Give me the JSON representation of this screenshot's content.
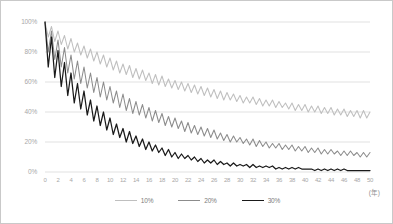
{
  "chart_data": {
    "type": "line",
    "title": "",
    "xlabel": "(年)",
    "ylabel": "",
    "xlim": [
      0,
      50
    ],
    "ylim": [
      0,
      100
    ],
    "grid": true,
    "legend_position": "bottom-center",
    "x_tick_labels": [
      "0",
      "2",
      "4",
      "6",
      "8",
      "10",
      "12",
      "14",
      "16",
      "18",
      "20",
      "22",
      "24",
      "26",
      "28",
      "30",
      "32",
      "34",
      "36",
      "38",
      "40",
      "42",
      "44",
      "46",
      "48",
      "50"
    ],
    "x_tick_values": [
      0,
      2,
      4,
      6,
      8,
      10,
      12,
      14,
      16,
      18,
      20,
      22,
      24,
      26,
      28,
      30,
      32,
      34,
      36,
      38,
      40,
      42,
      44,
      46,
      48,
      50
    ],
    "y_tick_labels": [
      "0%",
      "20%",
      "40%",
      "60%",
      "80%",
      "100%"
    ],
    "y_tick_values": [
      0,
      20,
      40,
      60,
      80,
      100
    ],
    "series": [
      {
        "name": "10%",
        "color": "#bfbfbf",
        "values": [
          100,
          90,
          97,
          87,
          94,
          85,
          91,
          82,
          89,
          80,
          86,
          78,
          84,
          76,
          82,
          74,
          80,
          72,
          78,
          70,
          76,
          68,
          74,
          66,
          72,
          65,
          71,
          63,
          69,
          62,
          68,
          61,
          66,
          59,
          65,
          58,
          64,
          57,
          62,
          56,
          61,
          55,
          60,
          54,
          59,
          53,
          58,
          52,
          57,
          51,
          56,
          50,
          55,
          49,
          54,
          48,
          53,
          48,
          52,
          47,
          51,
          46,
          50,
          46,
          50,
          45,
          49,
          44,
          48,
          44,
          48,
          43,
          47,
          43,
          46,
          42,
          46,
          41,
          45,
          41,
          45,
          40,
          44,
          40,
          44,
          39,
          43,
          39,
          43,
          38,
          42,
          38,
          42,
          37,
          41,
          37,
          41,
          36,
          41,
          36,
          40
        ]
      },
      {
        "name": "20%",
        "color": "#8c8c8c",
        "values": [
          100,
          80,
          94,
          75,
          88,
          70,
          83,
          66,
          78,
          62,
          74,
          59,
          70,
          56,
          66,
          53,
          63,
          50,
          60,
          48,
          57,
          46,
          54,
          43,
          52,
          41,
          49,
          39,
          47,
          38,
          45,
          36,
          43,
          34,
          41,
          33,
          39,
          31,
          37,
          30,
          36,
          29,
          34,
          27,
          33,
          26,
          31,
          25,
          30,
          24,
          29,
          23,
          28,
          22,
          26,
          21,
          25,
          20,
          24,
          20,
          23,
          19,
          22,
          18,
          22,
          17,
          21,
          17,
          20,
          16,
          19,
          16,
          19,
          15,
          18,
          15,
          18,
          14,
          17,
          14,
          17,
          13,
          16,
          13,
          16,
          12,
          15,
          12,
          15,
          12,
          14,
          11,
          14,
          11,
          14,
          11,
          13,
          10,
          13,
          10,
          13
        ]
      },
      {
        "name": "30%",
        "color": "#1a1a1a",
        "values": [
          100,
          70,
          90,
          63,
          81,
          57,
          73,
          51,
          66,
          46,
          59,
          42,
          54,
          38,
          48,
          34,
          44,
          31,
          40,
          28,
          36,
          25,
          32,
          23,
          29,
          20,
          27,
          19,
          24,
          17,
          22,
          15,
          20,
          14,
          18,
          13,
          16,
          11,
          15,
          10,
          13,
          9,
          12,
          9,
          11,
          8,
          10,
          7,
          9,
          6,
          8,
          6,
          8,
          5,
          7,
          5,
          6,
          4,
          6,
          4,
          5,
          4,
          5,
          3,
          5,
          3,
          4,
          3,
          4,
          3,
          4,
          2,
          3,
          2,
          3,
          2,
          3,
          2,
          3,
          2,
          2,
          2,
          2,
          1,
          2,
          1,
          2,
          1,
          2,
          1,
          2,
          1,
          2,
          1,
          1,
          1,
          1,
          1,
          1,
          1,
          1
        ]
      }
    ]
  },
  "axis": {
    "unit_label": "(年)"
  },
  "legend": {
    "items": [
      {
        "label": "10%",
        "color": "#bfbfbf"
      },
      {
        "label": "20%",
        "color": "#8c8c8c"
      },
      {
        "label": "30%",
        "color": "#1a1a1a"
      }
    ]
  },
  "colors": {
    "gridline": "#d9d9d9",
    "tick_text": "#a8a8a8",
    "border": "#c9c9c9",
    "background": "#ffffff"
  }
}
